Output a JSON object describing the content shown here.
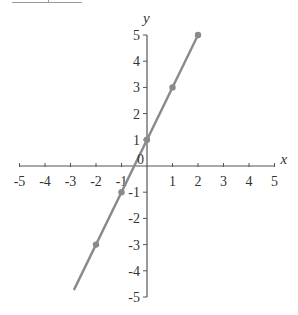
{
  "chart_data": {
    "type": "line",
    "title": "",
    "xlabel": "x",
    "ylabel": "y",
    "xlim": [
      -5,
      5
    ],
    "ylim": [
      -5,
      5
    ],
    "grid": false,
    "x_ticks": [
      -5,
      -4,
      -3,
      -2,
      -1,
      0,
      1,
      2,
      3,
      4,
      5
    ],
    "y_ticks": [
      -5,
      -4,
      -3,
      -2,
      -1,
      1,
      2,
      3,
      4,
      5
    ],
    "origin_label": "0",
    "series": [
      {
        "name": "y = 2x + 1",
        "color": "#8a8a8a",
        "line_start": [
          -2.85,
          -4.7
        ],
        "line_end": [
          2,
          5
        ],
        "points": [
          {
            "x": -2,
            "y": -3
          },
          {
            "x": -1,
            "y": -1
          },
          {
            "x": 0,
            "y": 1
          },
          {
            "x": 1,
            "y": 3
          },
          {
            "x": 2,
            "y": 5
          }
        ]
      }
    ]
  },
  "layout": {
    "origin_px": [
      147,
      166
    ],
    "x_unit_px": 25.5,
    "y_unit_px": 26.2,
    "axis_color": "#555555",
    "label_color": "#333333"
  }
}
